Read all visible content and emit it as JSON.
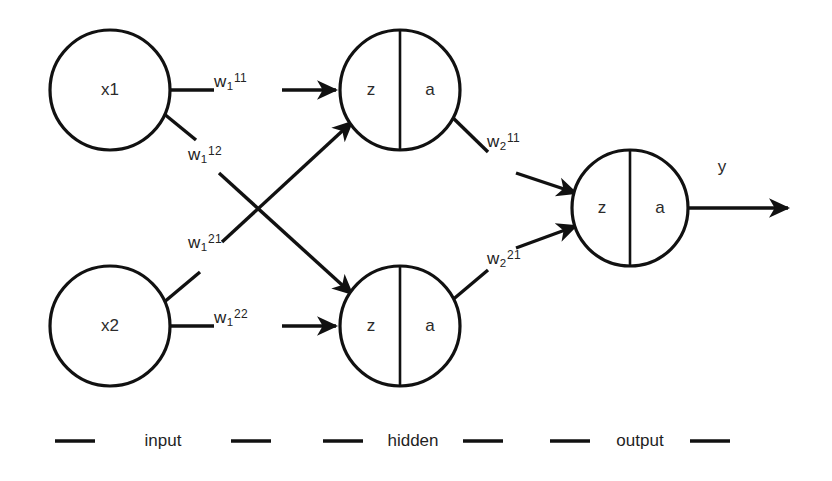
{
  "diagram": {
    "background_color": "#ffffff",
    "stroke_color": "#111111"
  },
  "nodes": {
    "input": [
      {
        "id": "x1",
        "label": "x1",
        "cx": 110,
        "cy": 90,
        "r": 60
      },
      {
        "id": "x2",
        "label": "x2",
        "cx": 110,
        "cy": 326,
        "r": 60
      }
    ],
    "hidden": [
      {
        "id": "h1",
        "left_label": "z",
        "right_label": "a",
        "cx": 400,
        "cy": 90,
        "r": 60
      },
      {
        "id": "h2",
        "left_label": "z",
        "right_label": "a",
        "cx": 400,
        "cy": 326,
        "r": 60
      }
    ],
    "output": [
      {
        "id": "o1",
        "left_label": "z",
        "right_label": "a",
        "cx": 630,
        "cy": 208,
        "r": 58
      }
    ]
  },
  "weights": [
    {
      "id": "w1_11",
      "base": "w",
      "sub": "1",
      "sup": "11",
      "from": "x1",
      "to": "h1",
      "x": 228,
      "y": 80
    },
    {
      "id": "w1_12",
      "base": "w",
      "sub": "1",
      "sup": "12",
      "from": "x1",
      "to": "h2",
      "x": 196,
      "y": 152
    },
    {
      "id": "w1_21",
      "base": "w",
      "sub": "1",
      "sup": "21",
      "from": "x2",
      "to": "h1",
      "x": 196,
      "y": 240
    },
    {
      "id": "w1_22",
      "base": "w",
      "sub": "1",
      "sup": "22",
      "from": "x2",
      "to": "h2",
      "x": 228,
      "y": 315
    },
    {
      "id": "w2_11",
      "base": "w",
      "sub": "2",
      "sup": "11",
      "from": "h1",
      "to": "o1",
      "x": 494,
      "y": 140
    },
    {
      "id": "w2_21",
      "base": "w",
      "sub": "2",
      "sup": "21",
      "from": "h2",
      "to": "o1",
      "x": 494,
      "y": 256
    }
  ],
  "output_signal": {
    "label": "y",
    "label_x": 722,
    "label_y": 168,
    "arrow_end_x": 795
  },
  "legend": {
    "items": [
      {
        "label": "input",
        "label_x": 163,
        "dash_left_x1": 55,
        "dash_left_x2": 95,
        "dash_right_x1": 231,
        "dash_right_x2": 271,
        "y": 441
      },
      {
        "label": "hidden",
        "label_x": 413,
        "dash_left_x1": 323,
        "dash_left_x2": 363,
        "dash_right_x1": 463,
        "dash_right_x2": 503,
        "y": 441
      },
      {
        "label": "output",
        "label_x": 640,
        "dash_left_x1": 550,
        "dash_left_x2": 590,
        "dash_right_x1": 690,
        "dash_right_x2": 730,
        "y": 441
      }
    ]
  }
}
